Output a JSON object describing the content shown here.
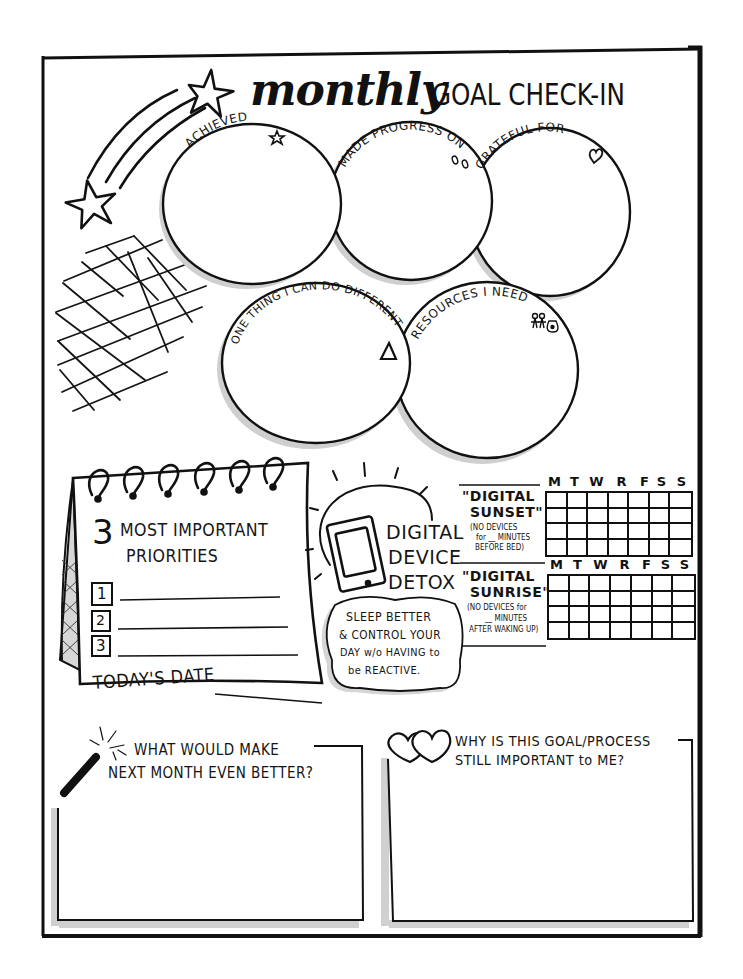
{
  "header": {
    "title_script": "monthly",
    "title_caps": "GOAL CHECK-IN",
    "decorations": [
      "shooting-star-icon",
      "star-icon",
      "grid-doodle"
    ]
  },
  "circles": [
    {
      "id": "achieved",
      "label": "ACHIEVED",
      "icon": "star-icon"
    },
    {
      "id": "made-progress",
      "label": "MADE PROGRESS ON",
      "icon": "footprints-icon"
    },
    {
      "id": "grateful",
      "label": "GRATEFUL FOR",
      "icon": "heart-icon"
    },
    {
      "id": "one-thing",
      "label": "ONE THING I CAN DO DIFFERENTLY",
      "icon": "delta-triangle-icon"
    },
    {
      "id": "resources",
      "label": "RESOURCES I NEED",
      "icon": "people-money-bag-icon"
    }
  ],
  "priorities": {
    "title_number": "3",
    "title_line1": "MOST IMPORTANT",
    "title_line2": "PRIORITIES",
    "items": [
      {
        "number": "1",
        "value": ""
      },
      {
        "number": "2",
        "value": ""
      },
      {
        "number": "3",
        "value": ""
      }
    ],
    "date_label": "TODAY'S DATE",
    "date_value": ""
  },
  "detox": {
    "title_line1": "DIGITAL",
    "title_line2": "DEVICE",
    "title_line3": "DETOX",
    "icon": "smartphone-icon",
    "cloud_line1": "SLEEP BETTER",
    "cloud_line2": "& CONTROL YOUR",
    "cloud_line3": "DAY w/o HAVING to",
    "cloud_line4": "be REACTIVE."
  },
  "trackers": {
    "days": [
      "M",
      "T",
      "W",
      "R",
      "F",
      "S",
      "S"
    ],
    "rows": 4,
    "sunset": {
      "title_line1": "\"DIGITAL",
      "title_line2": "SUNSET\"",
      "note_line1": "(NO DEVICES",
      "note_line2": "for __ MINUTES",
      "note_line3": "BEFORE BED)"
    },
    "sunrise": {
      "title_line1": "\"DIGITAL",
      "title_line2": "SUNRISE\"",
      "note_line1": "(NO DEVICES for",
      "note_line2": "__ MINUTES",
      "note_line3": "AFTER WAKING UP)"
    }
  },
  "reflection": {
    "better": {
      "line1": "WHAT WOULD MAKE",
      "line2": "NEXT MONTH EVEN BETTER?",
      "icon": "magic-wand-icon",
      "value": ""
    },
    "why": {
      "line1": "WHY IS THIS GOAL/PROCESS",
      "line2": "STILL IMPORTANT to ME?",
      "icon": "two-hearts-icon",
      "value": ""
    }
  }
}
